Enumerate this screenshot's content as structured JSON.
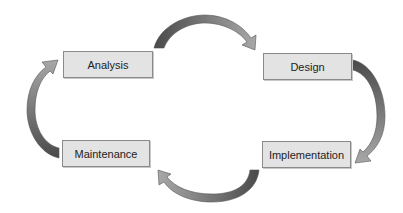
{
  "diagram": {
    "type": "cycle",
    "title": "",
    "stages": [
      {
        "id": "analysis",
        "label": "Analysis"
      },
      {
        "id": "design",
        "label": "Design"
      },
      {
        "id": "implementation",
        "label": "Implementation"
      },
      {
        "id": "maintenance",
        "label": "Maintenance"
      }
    ],
    "flow": [
      {
        "from": "Analysis",
        "to": "Design"
      },
      {
        "from": "Design",
        "to": "Implementation"
      },
      {
        "from": "Implementation",
        "to": "Maintenance"
      },
      {
        "from": "Maintenance",
        "to": "Analysis"
      }
    ],
    "colors": {
      "box_fill": "#e3e3e3",
      "box_border": "#8a8a8a",
      "text": "#222222",
      "arrow_dark": "#4a4a4a",
      "arrow_light": "#a8a8a8",
      "background": "#ffffff"
    }
  }
}
